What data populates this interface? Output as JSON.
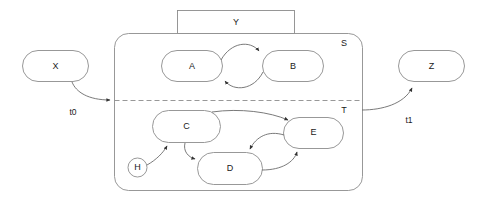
{
  "diagram": {
    "colors": {
      "stroke": "#8c8c8c",
      "edge_stroke": "#6b6b6b",
      "text": "#1a1a1a",
      "background": "#ffffff"
    },
    "outer_nodes": [
      {
        "id": "X",
        "label": "X"
      },
      {
        "id": "Z",
        "label": "Z"
      }
    ],
    "top_box": {
      "id": "Y",
      "label": "Y"
    },
    "container": {
      "id": "S",
      "label": "S",
      "sub_region_label": "T"
    },
    "upper_states": [
      {
        "id": "A",
        "label": "A"
      },
      {
        "id": "B",
        "label": "B"
      }
    ],
    "lower_states": [
      {
        "id": "C",
        "label": "C"
      },
      {
        "id": "D",
        "label": "D"
      },
      {
        "id": "E",
        "label": "E"
      }
    ],
    "initial_marker": {
      "id": "H",
      "label": "H"
    },
    "transitions": [
      {
        "id": "t0",
        "label": "t0",
        "from": "X",
        "to": "S"
      },
      {
        "id": "t1",
        "label": "t1",
        "from": "T",
        "to": "Z"
      },
      {
        "id": "ab",
        "label": "",
        "from": "A",
        "to": "B"
      },
      {
        "id": "ba",
        "label": "",
        "from": "B",
        "to": "A"
      },
      {
        "id": "ce",
        "label": "",
        "from": "C",
        "to": "E"
      },
      {
        "id": "cd",
        "label": "",
        "from": "C",
        "to": "D"
      },
      {
        "id": "ed",
        "label": "",
        "from": "E",
        "to": "D"
      },
      {
        "id": "de",
        "label": "",
        "from": "D",
        "to": "E"
      },
      {
        "id": "hc",
        "label": "",
        "from": "H",
        "to": "C"
      }
    ]
  }
}
